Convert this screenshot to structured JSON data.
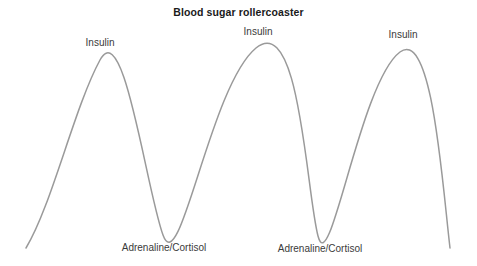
{
  "figure": {
    "width": 477,
    "height": 266,
    "background_color": "#ffffff",
    "title": "Blood sugar rollercoaster",
    "title_color": "#1a1a1a",
    "curve_color": "#9a9a9a",
    "label_color": "#3a3a3a"
  },
  "annotations": {
    "peaks": [
      {
        "label": "Insulin",
        "x": 100,
        "y": 36
      },
      {
        "label": "Insulin",
        "x": 258,
        "y": 25
      },
      {
        "label": "Insulin",
        "x": 403,
        "y": 28
      }
    ],
    "valleys": [
      {
        "label": "Adrenaline/Cortisol",
        "x": 164,
        "y": 241
      },
      {
        "label": "Adrenaline/Cortisol",
        "x": 320,
        "y": 242
      }
    ]
  },
  "chart_data": {
    "type": "line",
    "title": "Blood sugar rollercoaster",
    "xlabel": "",
    "ylabel": "",
    "grid": false,
    "legend": "none",
    "axes_visible": false,
    "tick_labels": [],
    "series": [
      {
        "name": "Blood sugar level",
        "color": "#9a9a9a",
        "line_width": 1.5,
        "points": [
          {
            "x": 26,
            "y": 248,
            "role": "start"
          },
          {
            "x": 100,
            "y": 60,
            "role": "peak",
            "label": "Insulin"
          },
          {
            "x": 163,
            "y": 235,
            "role": "valley",
            "label": "Adrenaline/Cortisol"
          },
          {
            "x": 256,
            "y": 48,
            "role": "peak",
            "label": "Insulin"
          },
          {
            "x": 318,
            "y": 236,
            "role": "valley",
            "label": "Adrenaline/Cortisol"
          },
          {
            "x": 400,
            "y": 52,
            "role": "peak",
            "label": "Insulin"
          },
          {
            "x": 450,
            "y": 248,
            "role": "end"
          }
        ],
        "path": "M 26,248 C 52,205 74,108 100,60 C 124,16 146,188 163,235 C 180,282 210,86 256,48 C 300,12 306,190 318,236 C 330,282 360,82 400,52 C 432,28 442,180 450,248"
      }
    ],
    "annotation_texts": [
      "Insulin",
      "Insulin",
      "Insulin",
      "Adrenaline/Cortisol",
      "Adrenaline/Cortisol"
    ]
  }
}
